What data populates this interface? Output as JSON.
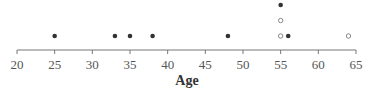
{
  "chart_data": {
    "type": "scatter",
    "subtype": "dot_plot",
    "title": "",
    "xlabel": "Age",
    "ylabel": "",
    "xlim": [
      20,
      65
    ],
    "xticks": [
      20,
      25,
      30,
      35,
      40,
      45,
      50,
      55,
      60,
      65
    ],
    "grid": false,
    "legend": null,
    "series": [
      {
        "name": "filled",
        "marker": "filled-circle",
        "points": [
          {
            "x": 25,
            "stack": 1
          },
          {
            "x": 33,
            "stack": 1
          },
          {
            "x": 35,
            "stack": 1
          },
          {
            "x": 38,
            "stack": 1
          },
          {
            "x": 48,
            "stack": 1
          },
          {
            "x": 55,
            "stack": 3
          },
          {
            "x": 56,
            "stack": 1
          }
        ]
      },
      {
        "name": "open",
        "marker": "open-circle",
        "points": [
          {
            "x": 55,
            "stack": 1
          },
          {
            "x": 55,
            "stack": 2
          },
          {
            "x": 64,
            "stack": 1
          }
        ]
      }
    ]
  },
  "axis": {
    "title": "Age",
    "tick_labels": [
      "20",
      "25",
      "30",
      "35",
      "40",
      "45",
      "50",
      "55",
      "60",
      "65"
    ]
  },
  "colors": {
    "axis": "#777777",
    "filled_dot": "#333333",
    "open_dot_stroke": "#888888",
    "tick_label": "#555555"
  }
}
